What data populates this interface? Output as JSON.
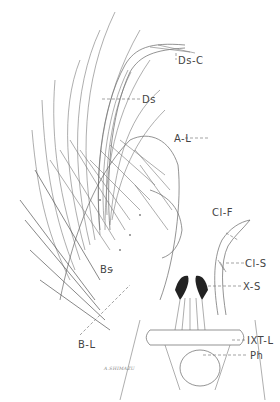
{
  "figure": {
    "type": "scientific line illustration",
    "signature": "A.SHIMAZU",
    "labels": [
      {
        "id": "ds-c",
        "text": "Ds-C"
      },
      {
        "id": "ds",
        "text": "Ds"
      },
      {
        "id": "a-l",
        "text": "A-L"
      },
      {
        "id": "cl-f",
        "text": "Cl-F"
      },
      {
        "id": "cl-s",
        "text": "Cl-S"
      },
      {
        "id": "bs",
        "text": "Bs"
      },
      {
        "id": "x-s",
        "text": "X-S"
      },
      {
        "id": "b-l",
        "text": "B-L"
      },
      {
        "id": "ixt-l",
        "text": "IXT-L"
      },
      {
        "id": "ph",
        "text": "Ph"
      }
    ]
  }
}
